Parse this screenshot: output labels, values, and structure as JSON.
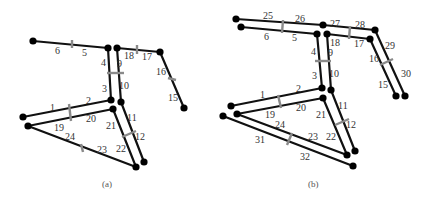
{
  "figure": {
    "panels": [
      {
        "caption": "(a)",
        "edges": [
          {
            "from": [
              33,
              41
            ],
            "to": [
              108,
              48
            ]
          },
          {
            "from": [
              117,
              48
            ],
            "to": [
              160,
              52
            ]
          },
          {
            "from": [
              160,
              52
            ],
            "to": [
              184,
              108
            ]
          },
          {
            "from": [
              108,
              48
            ],
            "to": [
              111,
              100
            ]
          },
          {
            "from": [
              117,
              48
            ],
            "to": [
              121,
              102
            ]
          },
          {
            "from": [
              111,
              100
            ],
            "to": [
              23,
              117
            ]
          },
          {
            "from": [
              113,
              109
            ],
            "to": [
              28,
              126
            ]
          },
          {
            "from": [
              121,
              102
            ],
            "to": [
              144,
              162
            ]
          },
          {
            "from": [
              113,
              109
            ],
            "to": [
              136,
              167
            ]
          },
          {
            "from": [
              28,
              126
            ],
            "to": [
              136,
              167
            ]
          }
        ],
        "ticks": [
          {
            "x1": 72,
            "y1": 40,
            "x2": 72,
            "y2": 48
          },
          {
            "x1": 137,
            "y1": 45,
            "x2": 137,
            "y2": 54
          },
          {
            "x1": 168,
            "y1": 78,
            "x2": 176,
            "y2": 80
          },
          {
            "x1": 107,
            "y1": 73,
            "x2": 124,
            "y2": 73
          },
          {
            "x1": 69,
            "y1": 104,
            "x2": 71,
            "y2": 121
          },
          {
            "x1": 122,
            "y1": 137,
            "x2": 136,
            "y2": 131
          },
          {
            "x1": 81,
            "y1": 144,
            "x2": 83,
            "y2": 152
          }
        ],
        "nodes": [
          [
            33,
            41
          ],
          [
            108,
            48
          ],
          [
            117,
            48
          ],
          [
            160,
            52
          ],
          [
            184,
            108
          ],
          [
            111,
            100
          ],
          [
            121,
            102
          ],
          [
            113,
            109
          ],
          [
            23,
            117
          ],
          [
            28,
            126
          ],
          [
            136,
            167
          ],
          [
            144,
            162
          ]
        ],
        "labels": [
          {
            "t": "6",
            "x": 55,
            "y": 54
          },
          {
            "t": "5",
            "x": 82,
            "y": 56
          },
          {
            "t": "18",
            "x": 124,
            "y": 59
          },
          {
            "t": "17",
            "x": 142,
            "y": 60
          },
          {
            "t": "16",
            "x": 156,
            "y": 75
          },
          {
            "t": "15",
            "x": 168,
            "y": 101
          },
          {
            "t": "4",
            "x": 101,
            "y": 66
          },
          {
            "t": "9",
            "x": 117,
            "y": 67
          },
          {
            "t": "3",
            "x": 102,
            "y": 92
          },
          {
            "t": "10",
            "x": 119,
            "y": 89
          },
          {
            "t": "1",
            "x": 50,
            "y": 111
          },
          {
            "t": "2",
            "x": 86,
            "y": 104
          },
          {
            "t": "19",
            "x": 54,
            "y": 131
          },
          {
            "t": "20",
            "x": 86,
            "y": 122
          },
          {
            "t": "21",
            "x": 106,
            "y": 129
          },
          {
            "t": "11",
            "x": 127,
            "y": 121
          },
          {
            "t": "24",
            "x": 65,
            "y": 140
          },
          {
            "t": "12",
            "x": 135,
            "y": 140
          },
          {
            "t": "23",
            "x": 97,
            "y": 153
          },
          {
            "t": "22",
            "x": 116,
            "y": 152
          }
        ],
        "caption_pos": {
          "x": 102,
          "y": 187
        }
      },
      {
        "caption": "(b)",
        "edges": [
          {
            "from": [
              236,
              19
            ],
            "to": [
              323,
              25
            ]
          },
          {
            "from": [
              241,
              27
            ],
            "to": [
              317,
              34
            ]
          },
          {
            "from": [
              323,
              25
            ],
            "to": [
              375,
              30
            ]
          },
          {
            "from": [
              327,
              34
            ],
            "to": [
              370,
              39
            ]
          },
          {
            "from": [
              375,
              30
            ],
            "to": [
              405,
              96
            ]
          },
          {
            "from": [
              370,
              39
            ],
            "to": [
              396,
              96
            ]
          },
          {
            "from": [
              317,
              34
            ],
            "to": [
              322,
              88
            ]
          },
          {
            "from": [
              327,
              34
            ],
            "to": [
              331,
              90
            ]
          },
          {
            "from": [
              322,
              88
            ],
            "to": [
              231,
              106
            ]
          },
          {
            "from": [
              323,
              98
            ],
            "to": [
              237,
              114
            ]
          },
          {
            "from": [
              331,
              90
            ],
            "to": [
              355,
              151
            ]
          },
          {
            "from": [
              323,
              98
            ],
            "to": [
              347,
              155
            ]
          },
          {
            "from": [
              237,
              114
            ],
            "to": [
              347,
              155
            ]
          },
          {
            "from": [
              223,
              116
            ],
            "to": [
              353,
              166
            ]
          }
        ],
        "ticks": [
          {
            "x1": 283,
            "y1": 20,
            "x2": 282,
            "y2": 33
          },
          {
            "x1": 350,
            "y1": 26,
            "x2": 349,
            "y2": 39
          },
          {
            "x1": 380,
            "y1": 65,
            "x2": 393,
            "y2": 59
          },
          {
            "x1": 315,
            "y1": 61,
            "x2": 331,
            "y2": 61
          },
          {
            "x1": 278,
            "y1": 95,
            "x2": 281,
            "y2": 108
          },
          {
            "x1": 335,
            "y1": 125,
            "x2": 349,
            "y2": 119
          },
          {
            "x1": 292,
            "y1": 133,
            "x2": 287,
            "y2": 145
          }
        ],
        "nodes": [
          [
            236,
            19
          ],
          [
            241,
            27
          ],
          [
            323,
            25
          ],
          [
            317,
            34
          ],
          [
            327,
            34
          ],
          [
            375,
            30
          ],
          [
            370,
            39
          ],
          [
            396,
            96
          ],
          [
            405,
            96
          ],
          [
            322,
            88
          ],
          [
            331,
            90
          ],
          [
            323,
            98
          ],
          [
            231,
            106
          ],
          [
            237,
            114
          ],
          [
            223,
            116
          ],
          [
            347,
            155
          ],
          [
            355,
            151
          ],
          [
            353,
            166
          ]
        ],
        "labels": [
          {
            "t": "25",
            "x": 263,
            "y": 19
          },
          {
            "t": "26",
            "x": 295,
            "y": 22
          },
          {
            "t": "27",
            "x": 330,
            "y": 27
          },
          {
            "t": "28",
            "x": 355,
            "y": 28
          },
          {
            "t": "6",
            "x": 264,
            "y": 40
          },
          {
            "t": "5",
            "x": 292,
            "y": 41
          },
          {
            "t": "18",
            "x": 330,
            "y": 46
          },
          {
            "t": "17",
            "x": 354,
            "y": 47
          },
          {
            "t": "29",
            "x": 385,
            "y": 49
          },
          {
            "t": "16",
            "x": 369,
            "y": 62
          },
          {
            "t": "30",
            "x": 401,
            "y": 77
          },
          {
            "t": "15",
            "x": 378,
            "y": 88
          },
          {
            "t": "4",
            "x": 311,
            "y": 55
          },
          {
            "t": "9",
            "x": 328,
            "y": 56
          },
          {
            "t": "3",
            "x": 312,
            "y": 79
          },
          {
            "t": "10",
            "x": 329,
            "y": 77
          },
          {
            "t": "1",
            "x": 260,
            "y": 98
          },
          {
            "t": "2",
            "x": 296,
            "y": 92
          },
          {
            "t": "19",
            "x": 265,
            "y": 118
          },
          {
            "t": "20",
            "x": 296,
            "y": 111
          },
          {
            "t": "21",
            "x": 316,
            "y": 118
          },
          {
            "t": "11",
            "x": 338,
            "y": 109
          },
          {
            "t": "24",
            "x": 275,
            "y": 128
          },
          {
            "t": "12",
            "x": 346,
            "y": 128
          },
          {
            "t": "31",
            "x": 255,
            "y": 143
          },
          {
            "t": "23",
            "x": 308,
            "y": 140
          },
          {
            "t": "22",
            "x": 326,
            "y": 140
          },
          {
            "t": "32",
            "x": 300,
            "y": 160
          }
        ],
        "caption_pos": {
          "x": 308,
          "y": 187
        }
      }
    ]
  }
}
